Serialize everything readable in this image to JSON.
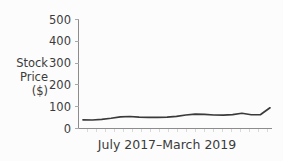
{
  "figure": {
    "background_color": "#fcfcfc",
    "line_color": "#3a3a3a",
    "axis_color": "#8c8c8c",
    "text_color": "#3b3b3b"
  },
  "axis": {
    "y_title_lines": [
      "Stock",
      "Price",
      "($)"
    ],
    "y_title_full": "Stock Price ($)",
    "x_label": "July 2017–March 2019",
    "y_tick_labels": [
      "500",
      "400",
      "300",
      "200",
      "100",
      "0"
    ]
  },
  "chart_data": {
    "type": "line",
    "title": "",
    "xlabel": "July 2017–March 2019",
    "ylabel": "Stock Price ($)",
    "ylim": [
      0,
      500
    ],
    "yticks": [
      0,
      100,
      200,
      300,
      400,
      500
    ],
    "grid": false,
    "legend": false,
    "x_axis_kind": "time-range",
    "x_range_start": "July 2017",
    "x_range_end": "March 2019",
    "x": [
      0,
      1,
      2,
      3,
      4,
      5,
      6,
      7,
      8,
      9,
      10,
      11,
      12,
      13,
      14,
      15,
      16,
      17,
      18,
      19,
      20
    ],
    "values": [
      40,
      39,
      42,
      47,
      53,
      55,
      52,
      51,
      51,
      52,
      56,
      62,
      66,
      65,
      62,
      61,
      64,
      70,
      63,
      64,
      95
    ],
    "series": [
      {
        "name": "Stock Price",
        "color": "#3a3a3a",
        "values": [
          40,
          39,
          42,
          47,
          53,
          55,
          52,
          51,
          51,
          52,
          56,
          62,
          66,
          65,
          62,
          61,
          64,
          70,
          63,
          64,
          95
        ]
      }
    ]
  }
}
